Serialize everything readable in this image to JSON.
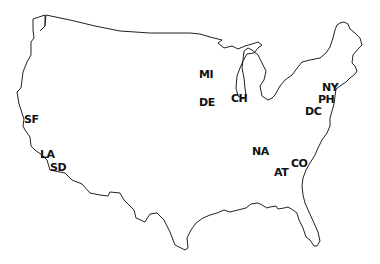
{
  "map": {
    "background": "#ffffff",
    "outline_color": "#222222",
    "label_color": "#111111"
  },
  "cities": [
    {
      "code": "SF",
      "x": 24,
      "y": 114
    },
    {
      "code": "LA",
      "x": 40,
      "y": 149
    },
    {
      "code": "SD",
      "x": 50,
      "y": 162
    },
    {
      "code": "MI",
      "x": 199,
      "y": 69
    },
    {
      "code": "DE",
      "x": 199,
      "y": 97
    },
    {
      "code": "CH",
      "x": 231,
      "y": 93
    },
    {
      "code": "NY",
      "x": 322,
      "y": 82
    },
    {
      "code": "PH",
      "x": 318,
      "y": 94
    },
    {
      "code": "DC",
      "x": 305,
      "y": 106
    },
    {
      "code": "NA",
      "x": 252,
      "y": 146
    },
    {
      "code": "AT",
      "x": 274,
      "y": 167
    },
    {
      "code": "CO",
      "x": 291,
      "y": 158
    }
  ]
}
